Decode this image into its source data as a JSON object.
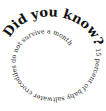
{
  "spiral": {
    "heading": "Did you know?",
    "body": " 15 percent of baby saltwater crocodiles do not survive a month",
    "text_color": "#111111",
    "background": "#ffffff"
  }
}
